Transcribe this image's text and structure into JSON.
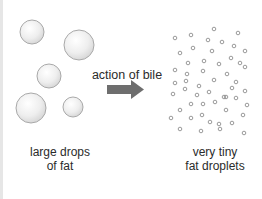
{
  "diagram": {
    "left_group": {
      "label_line1": "large drops",
      "label_line2": "of fat",
      "drops": [
        {
          "cx": 32,
          "cy": 32,
          "r": 12
        },
        {
          "cx": 79,
          "cy": 45,
          "r": 15
        },
        {
          "cx": 49,
          "cy": 76,
          "r": 12
        },
        {
          "cx": 31,
          "cy": 108,
          "r": 15
        },
        {
          "cx": 73,
          "cy": 107,
          "r": 10
        }
      ]
    },
    "process": {
      "label": "action of bile",
      "arrow_color": "#6e6e6e"
    },
    "right_group": {
      "label_line1": "very tiny",
      "label_line2": "fat droplets",
      "droplet_count": 52
    },
    "colors": {
      "drop_fill": "#eeeeee",
      "drop_stroke": "#a9a9a9",
      "droplet_stroke": "#8f8f8f",
      "text": "#2b2b2b"
    }
  }
}
